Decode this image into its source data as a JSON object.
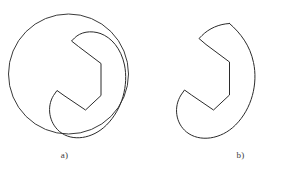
{
  "figure": {
    "background_color": "#ffffff",
    "stroke_color": "#2b2b2b",
    "circle_stroke_color": "#3a3a3a",
    "stroke_width": 1,
    "panels": [
      {
        "id": "a",
        "caption": "a)",
        "description": "C-shaped hook outline inscribed in a circle",
        "has_circle": true,
        "circle": {
          "cx": 68.5,
          "cy": 74,
          "r": 60
        },
        "shape_bounds": {
          "x": 36,
          "y": 22,
          "width": 96,
          "height": 116
        }
      },
      {
        "id": "b",
        "caption": "b)",
        "description": "C-shaped hook outline shown alone",
        "has_circle": false,
        "shape_bounds": {
          "x": 170,
          "y": 22,
          "width": 88,
          "height": 116
        }
      }
    ]
  },
  "captions": {
    "a": "a)",
    "b": "b)"
  }
}
